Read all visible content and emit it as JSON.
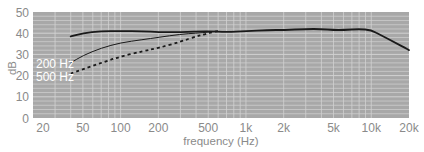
{
  "chart_data": {
    "type": "line",
    "title": "",
    "xlabel": "frequency (Hz)",
    "ylabel": "dB",
    "xscale": "log",
    "xlim": [
      20,
      20000
    ],
    "ylim": [
      0,
      50
    ],
    "grid": true,
    "legend": "inline labels",
    "x_ticks": [
      20,
      50,
      100,
      200,
      500,
      1000,
      2000,
      5000,
      10000,
      20000
    ],
    "x_tick_labels": [
      "20",
      "50",
      "100",
      "200",
      "500",
      "1k",
      "2k",
      "5k",
      "10k",
      "20k"
    ],
    "y_ticks": [
      0,
      10,
      20,
      30,
      40,
      50
    ],
    "y_tick_labels": [
      "0",
      "10",
      "20",
      "30",
      "40",
      "50"
    ],
    "series": [
      {
        "name": "flat",
        "style": "solid-thick",
        "color": "#1a1a1a",
        "x": [
          40,
          50,
          70,
          100,
          150,
          200,
          300,
          500,
          700,
          1000,
          1500,
          2000,
          3000,
          4000,
          5000,
          6000,
          8000,
          10000,
          12000,
          15000,
          20000
        ],
        "values": [
          38.5,
          40,
          41,
          41,
          41,
          40.5,
          40.5,
          41,
          40.5,
          41,
          41.5,
          41.5,
          42,
          42,
          41.5,
          41.5,
          42,
          41.5,
          39,
          36,
          32
        ]
      },
      {
        "name": "200 Hz",
        "style": "solid-thin",
        "color": "#1a1a1a",
        "x": [
          40,
          50,
          70,
          100,
          150,
          200,
          300,
          400,
          500,
          600
        ],
        "values": [
          26,
          29.5,
          33,
          35.5,
          37,
          38,
          39.5,
          40,
          40.5,
          41
        ]
      },
      {
        "name": "500 Hz",
        "style": "dashed",
        "color": "#1a1a1a",
        "x": [
          40,
          50,
          70,
          100,
          150,
          200,
          300,
          400,
          500,
          600
        ],
        "values": [
          21,
          23,
          26,
          29,
          31.5,
          33,
          36,
          38.5,
          40,
          41
        ]
      }
    ],
    "annotations": [
      "200 Hz",
      "500 Hz"
    ]
  },
  "style": {
    "plot_bg": "#a8a8a8",
    "grid_color": "#d2d2d2",
    "text_color": "#8a8a8a",
    "line_color": "#1a1a1a"
  }
}
